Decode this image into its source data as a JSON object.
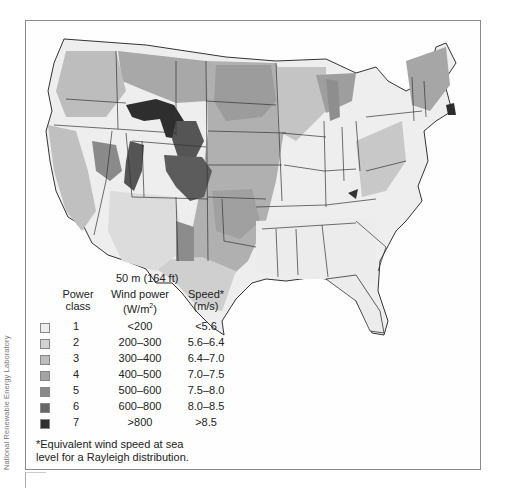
{
  "figure": {
    "credit": "National Renewable Energy Laboratory",
    "height_label": "50 m (164 ft)",
    "footnote": "*Equivalent wind speed at sea level for a Rayleigh distribution."
  },
  "legend": {
    "headers": {
      "class_line1": "Power",
      "class_line2": "class",
      "power_line1": "Wind power",
      "power_line2_pre": "(W/m",
      "power_line2_sup": "2",
      "power_line2_post": ")",
      "speed_line1": "Speed*",
      "speed_line2": "(m/s)"
    },
    "rows": [
      {
        "class": "1",
        "power": "<200",
        "speed": "<5.6",
        "color": "#ececec"
      },
      {
        "class": "2",
        "power": "200–300",
        "speed": "5.6–6.4",
        "color": "#d2d2d2"
      },
      {
        "class": "3",
        "power": "300–400",
        "speed": "6.4–7.0",
        "color": "#bcbcbc"
      },
      {
        "class": "4",
        "power": "400–500",
        "speed": "7.0–7.5",
        "color": "#a4a4a4"
      },
      {
        "class": "5",
        "power": "500–600",
        "speed": "7.5–8.0",
        "color": "#8a8a8a"
      },
      {
        "class": "6",
        "power": "600–800",
        "speed": "8.0–8.5",
        "color": "#666666"
      },
      {
        "class": "7",
        "power": ">800",
        "speed": ">8.5",
        "color": "#2e2e2e"
      }
    ]
  },
  "map": {
    "subject": "United States wind power classes at 50 m",
    "border_color": "#333333",
    "background": "#fefefe"
  }
}
